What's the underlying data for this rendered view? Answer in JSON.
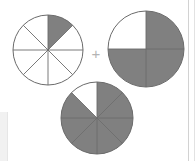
{
  "page": {
    "width": 195,
    "height": 161,
    "background_color": "#ffffff",
    "operator_label": "+"
  },
  "style": {
    "shaded_color": "#808080",
    "unshaded_color": "#ffffff",
    "outline_color": "#6b6b6b",
    "divider_color": "#6b6b6b",
    "scan_edge_color": "#d2d2d2",
    "scan_patch_color": "#f1f1f1",
    "plus_color": "#b4b4b4"
  },
  "chart_data": {
    "type": "pie",
    "title": "",
    "xlabel": "",
    "ylabel": "",
    "legend": [],
    "charts": [
      {
        "name": "first-addend",
        "fraction_label": "1/8",
        "numerator": 1,
        "denominator": 8,
        "total_sectors": 8,
        "shaded_sectors": 1,
        "shaded_indices": [
          0
        ],
        "sector_angle_degrees": 45,
        "start_angle_degrees": 0,
        "center_x": 48,
        "center_y": 50,
        "radius": 35,
        "values": [
          12.5,
          87.5
        ],
        "categories": [
          "shaded",
          "unshaded"
        ]
      },
      {
        "name": "second-addend",
        "fraction_label": "3/4",
        "numerator": 3,
        "denominator": 4,
        "total_sectors": 4,
        "shaded_sectors": 3,
        "shaded_indices": [
          0,
          1,
          2
        ],
        "sector_angle_degrees": 90,
        "start_angle_degrees": 0,
        "center_x": 146,
        "center_y": 49,
        "radius": 38,
        "values": [
          75,
          25
        ],
        "categories": [
          "shaded",
          "unshaded"
        ]
      },
      {
        "name": "sum-result",
        "fraction_label": "7/8",
        "numerator": 7,
        "denominator": 8,
        "total_sectors": 8,
        "shaded_sectors": 7,
        "shaded_indices": [
          0,
          1,
          2,
          3,
          4,
          5,
          6
        ],
        "sector_angle_degrees": 45,
        "start_angle_degrees": 0,
        "center_x": 97,
        "center_y": 118,
        "radius": 36,
        "values": [
          87.5,
          12.5
        ],
        "categories": [
          "shaded",
          "unshaded"
        ]
      }
    ]
  }
}
